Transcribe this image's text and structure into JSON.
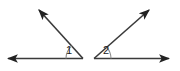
{
  "figure": {
    "background_color": "#ffffff",
    "stroke_color": "#333333",
    "arc_color": "#808080",
    "label_color": "#1a1a1a"
  },
  "angles": [
    {
      "id": "angle-1",
      "label": "1",
      "vertex": {
        "x": 83,
        "y": 58
      },
      "label_position": {
        "x": 68,
        "y": 50
      },
      "arc_radius": 17,
      "rays": [
        {
          "name": "horizontal-ray-left",
          "direction": "left",
          "from": {
            "x": 83,
            "y": 58
          },
          "to": {
            "x": 5,
            "y": 58
          },
          "arrow": "at-end"
        },
        {
          "name": "slanted-ray-upleft",
          "direction": "up-left",
          "from": {
            "x": 83,
            "y": 58
          },
          "to": {
            "x": 36,
            "y": 7
          },
          "arrow": "at-end"
        }
      ]
    },
    {
      "id": "angle-2",
      "label": "2",
      "vertex": {
        "x": 94,
        "y": 58
      },
      "label_position": {
        "x": 108,
        "y": 50
      },
      "arc_radius": 17,
      "rays": [
        {
          "name": "horizontal-ray-right",
          "direction": "right",
          "from": {
            "x": 94,
            "y": 58
          },
          "to": {
            "x": 172,
            "y": 58
          },
          "arrow": "at-end"
        },
        {
          "name": "slanted-ray-upright",
          "direction": "up-right",
          "from": {
            "x": 94,
            "y": 58
          },
          "to": {
            "x": 152,
            "y": 7
          },
          "arrow": "at-end"
        }
      ]
    }
  ]
}
